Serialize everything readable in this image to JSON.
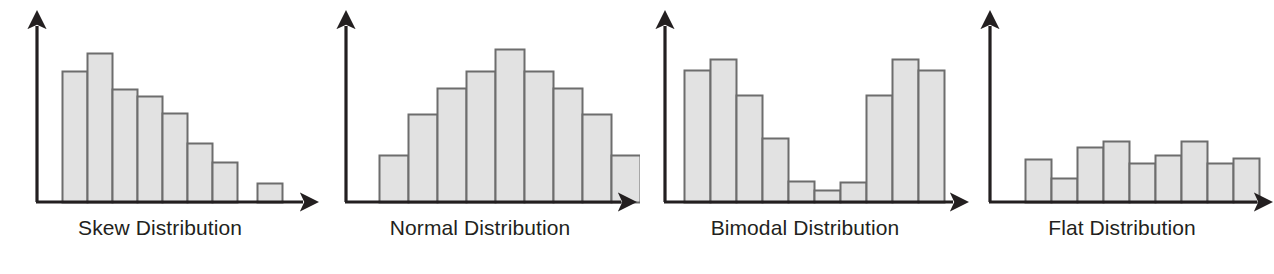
{
  "figure": {
    "width": 1274,
    "height": 274,
    "background": "#ffffff",
    "axis_color": "#231f20",
    "bar_fill": "#e2e2e2",
    "bar_stroke": "#6d6d6d",
    "caption_color": "#231f20"
  },
  "chart_data": [
    {
      "type": "bar",
      "title": "Skew Distribution",
      "xlabel": "",
      "ylabel": "",
      "grid": false,
      "legend": "none",
      "axis_arrows": true,
      "tick_labels": [],
      "ylim": [
        0,
        100
      ],
      "categories": [
        "1",
        "2",
        "3",
        "4",
        "5",
        "6",
        "7",
        "8",
        "9",
        "10"
      ],
      "values": [
        73,
        84,
        58,
        53,
        42,
        28,
        20,
        0,
        8,
        0
      ],
      "note": "Right-skewed: tall bars at left tapering down, one small isolated outlier bar near the right after a gap."
    },
    {
      "type": "bar",
      "title": "Normal Distribution",
      "xlabel": "",
      "ylabel": "",
      "grid": false,
      "legend": "none",
      "axis_arrows": true,
      "tick_labels": [],
      "ylim": [
        0,
        100
      ],
      "categories": [
        "1",
        "2",
        "3",
        "4",
        "5",
        "6",
        "7",
        "8",
        "9"
      ],
      "values": [
        26,
        48,
        63,
        77,
        90,
        77,
        63,
        48,
        26
      ],
      "note": "Symmetric bell shape peaking at the central bar."
    },
    {
      "type": "bar",
      "title": "Bimodal Distribution",
      "xlabel": "",
      "ylabel": "",
      "grid": false,
      "legend": "none",
      "axis_arrows": true,
      "tick_labels": [],
      "ylim": [
        0,
        100
      ],
      "categories": [
        "1",
        "2",
        "3",
        "4",
        "5",
        "6",
        "7",
        "8",
        "9",
        "10"
      ],
      "values": [
        78,
        87,
        64,
        38,
        13,
        7,
        12,
        64,
        87,
        78
      ],
      "note": "Two separated peaks at the left and right with a low valley in the middle."
    },
    {
      "type": "bar",
      "title": "Flat Distribution",
      "xlabel": "",
      "ylabel": "",
      "grid": false,
      "legend": "none",
      "axis_arrows": true,
      "tick_labels": [],
      "ylim": [
        0,
        100
      ],
      "categories": [
        "1",
        "2",
        "3",
        "4",
        "5",
        "6",
        "7",
        "8"
      ],
      "values": [
        26,
        16,
        34,
        38,
        22,
        28,
        38,
        22,
        26
      ],
      "note": "Roughly uniform low bars of similar height across the axis."
    }
  ],
  "panels": [
    {
      "id": "skew",
      "caption": "Skew Distribution",
      "caption_left": 0,
      "caption_width": 320,
      "caption_top": 216,
      "width": 320,
      "origin_x": 37,
      "baseline_y": 202,
      "y_axis_top": 18,
      "x_axis_end": 312,
      "bar_width": 25,
      "bars": [
        {
          "x": 62,
          "top": 71,
          "name": "bar-1"
        },
        {
          "x": 87,
          "top": 53,
          "name": "bar-2"
        },
        {
          "x": 112,
          "top": 89,
          "name": "bar-3"
        },
        {
          "x": 137,
          "top": 96,
          "name": "bar-4"
        },
        {
          "x": 162,
          "top": 113,
          "name": "bar-5"
        },
        {
          "x": 187,
          "top": 143,
          "name": "bar-6"
        },
        {
          "x": 212,
          "top": 162,
          "name": "bar-7"
        },
        {
          "x": 257,
          "top": 183,
          "name": "bar-8-outlier"
        }
      ]
    },
    {
      "id": "normal",
      "caption": "Normal Distribution",
      "caption_left": 320,
      "caption_width": 320,
      "caption_top": 216,
      "width": 320,
      "origin_x": 26,
      "baseline_y": 202,
      "y_axis_top": 18,
      "x_axis_end": 310,
      "bar_width": 29,
      "bars": [
        {
          "x": 59,
          "top": 155,
          "name": "bar-1"
        },
        {
          "x": 88,
          "top": 114,
          "name": "bar-2"
        },
        {
          "x": 117,
          "top": 88,
          "name": "bar-3"
        },
        {
          "x": 146,
          "top": 71,
          "name": "bar-4"
        },
        {
          "x": 175,
          "top": 49,
          "name": "bar-5"
        },
        {
          "x": 204,
          "top": 71,
          "name": "bar-6"
        },
        {
          "x": 233,
          "top": 88,
          "name": "bar-7"
        },
        {
          "x": 262,
          "top": 114,
          "name": "bar-8"
        },
        {
          "x": 291,
          "top": 155,
          "name": "bar-9"
        }
      ]
    },
    {
      "id": "bimodal",
      "caption": "Bimodal Distribution",
      "caption_left": 640,
      "caption_width": 330,
      "caption_top": 216,
      "width": 330,
      "origin_x": 25,
      "baseline_y": 202,
      "y_axis_top": 18,
      "x_axis_end": 322,
      "bar_width": 26,
      "bars": [
        {
          "x": 44,
          "top": 70,
          "name": "bar-1"
        },
        {
          "x": 70,
          "top": 59,
          "name": "bar-2"
        },
        {
          "x": 96,
          "top": 95,
          "name": "bar-3"
        },
        {
          "x": 122,
          "top": 138,
          "name": "bar-4"
        },
        {
          "x": 148,
          "top": 181,
          "name": "bar-5"
        },
        {
          "x": 174,
          "top": 190,
          "name": "bar-6"
        },
        {
          "x": 200,
          "top": 182,
          "name": "bar-7"
        },
        {
          "x": 226,
          "top": 95,
          "name": "bar-8"
        },
        {
          "x": 252,
          "top": 59,
          "name": "bar-9"
        },
        {
          "x": 278,
          "top": 70,
          "name": "bar-10"
        }
      ]
    },
    {
      "id": "flat",
      "caption": "Flat Distribution",
      "caption_left": 970,
      "caption_width": 304,
      "caption_top": 216,
      "width": 304,
      "origin_x": 20,
      "baseline_y": 202,
      "y_axis_top": 18,
      "x_axis_end": 296,
      "bar_width": 26,
      "bars": [
        {
          "x": 55,
          "top": 159,
          "name": "bar-1"
        },
        {
          "x": 81,
          "top": 178,
          "name": "bar-2"
        },
        {
          "x": 107,
          "top": 147,
          "name": "bar-3"
        },
        {
          "x": 133,
          "top": 141,
          "name": "bar-4"
        },
        {
          "x": 159,
          "top": 163,
          "name": "bar-5"
        },
        {
          "x": 185,
          "top": 155,
          "name": "bar-6"
        },
        {
          "x": 211,
          "top": 141,
          "name": "bar-7"
        },
        {
          "x": 237,
          "top": 163,
          "name": "bar-8"
        },
        {
          "x": 263,
          "top": 158,
          "name": "bar-9"
        }
      ]
    }
  ]
}
